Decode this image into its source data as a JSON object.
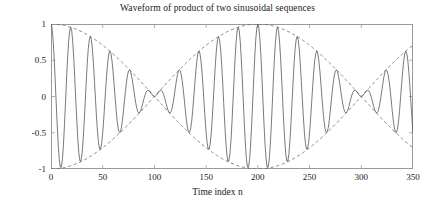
{
  "chart_data": {
    "type": "line",
    "title": "Waveform of product of two sinusoidal sequences",
    "xlabel": "Time index n",
    "ylabel": "Amplitude",
    "xlim": [
      0,
      350
    ],
    "ylim": [
      -1,
      1
    ],
    "xticks": [
      0,
      50,
      100,
      150,
      200,
      250,
      300,
      350
    ],
    "xtick_labels": [
      "0",
      "50",
      "100",
      "150",
      "200",
      "250",
      "300",
      "350"
    ],
    "yticks": [
      -1,
      -0.5,
      0,
      0.5,
      1
    ],
    "ytick_labels": [
      "-1",
      "-0.5",
      "0",
      "0.5",
      "1"
    ],
    "grid": false,
    "legend": false,
    "box": true,
    "series": [
      {
        "name": "product waveform",
        "style": "solid",
        "color": "#4d4d4d",
        "formula": "cos(2*pi*0.0525*n) * cos(2*pi*0.0025*n)",
        "description": "Product of two sinusoidal sequences: a fast carrier of period about 19 samples modulated by a slow envelope of period 400 samples (|envelope| repeats every 200 samples).",
        "n_start": 0,
        "n_end": 350,
        "n_step": 1,
        "carrier_frequency_cycles_per_sample": 0.0525,
        "modulation_frequency_cycles_per_sample": 0.0025,
        "value_at_n0": 1,
        "envelope_nodes_at_n": [
          100,
          300
        ],
        "envelope_peaks_at_n": [
          0,
          200
        ]
      },
      {
        "name": "upper envelope",
        "style": "dashed",
        "color": "#6a6a6a",
        "formula": "cos(2*pi*0.0025*n)",
        "description": "Upper dashed envelope curve",
        "n_start": 0,
        "n_end": 350,
        "n_step": 1
      },
      {
        "name": "lower envelope",
        "style": "dashed",
        "color": "#6a6a6a",
        "formula": "-cos(2*pi*0.0025*n)",
        "description": "Lower dashed envelope curve (mirror of upper)",
        "n_start": 0,
        "n_end": 350,
        "n_step": 1
      }
    ]
  },
  "colors": {
    "background": "#ffffff",
    "axis": "#9a9a9a",
    "waveform": "#4d4d4d",
    "envelope": "#6a6a6a",
    "text": "#1a1a1a"
  }
}
